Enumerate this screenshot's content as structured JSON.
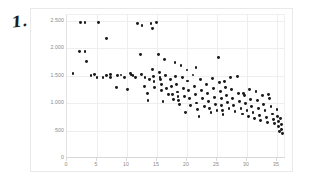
{
  "annotation": {
    "mark": "1."
  },
  "chart_data": {
    "type": "scatter",
    "title": "",
    "subtitle": "",
    "xlabel": "",
    "ylabel": "",
    "xlim": [
      0,
      36.5
    ],
    "ylim": [
      0,
      2600
    ],
    "grid": true,
    "legend": null,
    "marker_color": "#1a1a1a",
    "marker_size_px": 2.9,
    "xticks": [
      0,
      5,
      10,
      15,
      20,
      25,
      30,
      35
    ],
    "xticklabels": [
      "0",
      "5",
      "10",
      "15",
      "20",
      "25",
      "30",
      "35"
    ],
    "yticks": [
      0,
      500,
      1000,
      1500,
      2000,
      2500
    ],
    "yticklabels": [
      "0",
      "500",
      "1.000",
      "1.500",
      "2.000",
      "2.500"
    ],
    "series": [
      {
        "name": "observations",
        "points": [
          [
            1.0,
            1530
          ],
          [
            2.2,
            2470
          ],
          [
            3.0,
            2470
          ],
          [
            2.1,
            1930
          ],
          [
            3.0,
            1930
          ],
          [
            3.2,
            1760
          ],
          [
            4.6,
            1520
          ],
          [
            5.2,
            2460
          ],
          [
            5.0,
            1460
          ],
          [
            6.6,
            1500
          ],
          [
            6.6,
            2180
          ],
          [
            7.2,
            1520
          ],
          [
            7.3,
            1460
          ],
          [
            8.4,
            1500
          ],
          [
            8.2,
            1290
          ],
          [
            9.6,
            1470
          ],
          [
            10.1,
            1240
          ],
          [
            10.6,
            1530
          ],
          [
            10.7,
            1510
          ],
          [
            11.4,
            1470
          ],
          [
            11.8,
            2450
          ],
          [
            12.5,
            2410
          ],
          [
            12.3,
            1880
          ],
          [
            12.4,
            1520
          ],
          [
            13.0,
            1460
          ],
          [
            12.9,
            1300
          ],
          [
            13.4,
            1180
          ],
          [
            13.8,
            1430
          ],
          [
            14.0,
            2440
          ],
          [
            14.2,
            2350
          ],
          [
            14.3,
            1610
          ],
          [
            14.4,
            1480
          ],
          [
            14.5,
            1390
          ],
          [
            14.6,
            1290
          ],
          [
            14.9,
            2460
          ],
          [
            15.3,
            1880
          ],
          [
            15.4,
            1560
          ],
          [
            15.5,
            1470
          ],
          [
            15.6,
            1420
          ],
          [
            15.7,
            1330
          ],
          [
            15.8,
            1230
          ],
          [
            16.3,
            1790
          ],
          [
            16.4,
            1500
          ],
          [
            16.6,
            1260
          ],
          [
            16.9,
            1150
          ],
          [
            17.3,
            1420
          ],
          [
            17.4,
            1300
          ],
          [
            17.6,
            1160
          ],
          [
            17.8,
            1060
          ],
          [
            18.0,
            1730
          ],
          [
            18.1,
            1480
          ],
          [
            18.2,
            1330
          ],
          [
            18.4,
            1200
          ],
          [
            18.5,
            1120
          ],
          [
            18.6,
            1040
          ],
          [
            18.7,
            980
          ],
          [
            19.2,
            1460
          ],
          [
            19.4,
            1270
          ],
          [
            19.6,
            1120
          ],
          [
            20.0,
            1600
          ],
          [
            20.1,
            1400
          ],
          [
            20.2,
            1220
          ],
          [
            20.4,
            1080
          ],
          [
            20.6,
            960
          ],
          [
            21.0,
            1510
          ],
          [
            21.2,
            1300
          ],
          [
            21.4,
            1160
          ],
          [
            21.6,
            1000
          ],
          [
            21.8,
            880
          ],
          [
            22.2,
            1420
          ],
          [
            22.4,
            1230
          ],
          [
            22.6,
            1080
          ],
          [
            22.9,
            940
          ],
          [
            23.2,
            1330
          ],
          [
            23.4,
            1180
          ],
          [
            23.6,
            1020
          ],
          [
            23.8,
            900
          ],
          [
            24.0,
            820
          ],
          [
            24.4,
            1260
          ],
          [
            24.6,
            1100
          ],
          [
            24.8,
            980
          ],
          [
            25.0,
            860
          ],
          [
            25.2,
            1820
          ],
          [
            25.4,
            1380
          ],
          [
            25.6,
            1210
          ],
          [
            25.7,
            1090
          ],
          [
            25.8,
            960
          ],
          [
            25.9,
            870
          ],
          [
            26.0,
            790
          ],
          [
            26.4,
            1290
          ],
          [
            26.6,
            1130
          ],
          [
            26.8,
            1010
          ],
          [
            27.0,
            900
          ],
          [
            27.4,
            1240
          ],
          [
            27.6,
            1080
          ],
          [
            27.8,
            950
          ],
          [
            28.0,
            840
          ],
          [
            28.4,
            1490
          ],
          [
            28.6,
            1180
          ],
          [
            28.8,
            1020
          ],
          [
            29.0,
            900
          ],
          [
            29.2,
            800
          ],
          [
            29.6,
            1130
          ],
          [
            29.8,
            990
          ],
          [
            30.0,
            870
          ],
          [
            30.2,
            760
          ],
          [
            30.6,
            1060
          ],
          [
            30.8,
            930
          ],
          [
            31.0,
            820
          ],
          [
            31.2,
            720
          ],
          [
            31.5,
            1210
          ],
          [
            31.7,
            1040
          ],
          [
            31.9,
            900
          ],
          [
            32.1,
            780
          ],
          [
            32.3,
            690
          ],
          [
            32.6,
            1140
          ],
          [
            32.8,
            980
          ],
          [
            33.0,
            860
          ],
          [
            33.2,
            740
          ],
          [
            33.4,
            650
          ],
          [
            33.8,
            1080
          ],
          [
            34.0,
            930
          ],
          [
            34.2,
            800
          ],
          [
            34.4,
            700
          ],
          [
            34.6,
            620
          ],
          [
            35.0,
            880
          ],
          [
            35.1,
            760
          ],
          [
            35.2,
            660
          ],
          [
            35.3,
            570
          ],
          [
            35.4,
            490
          ],
          [
            35.6,
            720
          ],
          [
            35.7,
            610
          ],
          [
            35.8,
            520
          ],
          [
            35.9,
            450
          ],
          [
            19.8,
            820
          ],
          [
            22.0,
            760
          ],
          [
            16.0,
            1020
          ],
          [
            13.5,
            1040
          ],
          [
            9.0,
            1510
          ],
          [
            4.0,
            1500
          ],
          [
            6.0,
            1470
          ],
          [
            11.0,
            1500
          ],
          [
            27.2,
            1460
          ],
          [
            29.4,
            1180
          ],
          [
            24.2,
            1450
          ],
          [
            26.2,
            1390
          ],
          [
            30.4,
            1250
          ],
          [
            33.6,
            1150
          ],
          [
            21.5,
            1640
          ],
          [
            19.0,
            1680
          ]
        ]
      }
    ]
  }
}
